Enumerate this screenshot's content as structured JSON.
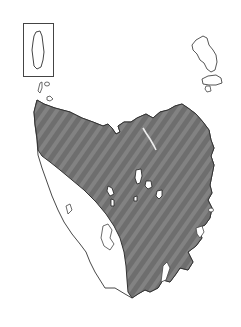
{
  "map": {
    "subject": "Tasmania",
    "features": [
      {
        "name": "King Island",
        "in_inset": true
      },
      {
        "name": "Flinders Island",
        "in_inset": false
      },
      {
        "name": "Tasmania mainland",
        "in_inset": false
      }
    ],
    "shaded_region": {
      "description": "Northern, central and eastern Tasmania shaded",
      "fill": "#6e6e6e",
      "stripe": "#8a8a8a"
    },
    "unshaded_region": {
      "description": "South-west Tasmania unshaded",
      "fill": "#ffffff"
    },
    "colors": {
      "outline": "#333333",
      "background": "#ffffff",
      "inset_border": "#444444"
    }
  }
}
